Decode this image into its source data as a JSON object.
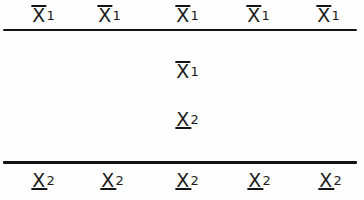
{
  "figure": {
    "background_color": "#fefefe",
    "ink_color": "#141414",
    "width": 364,
    "height": 200
  },
  "rules": [
    {
      "name": "upper-rule",
      "y": 29,
      "thickness": 2,
      "x_start": 3,
      "x_end": 357
    },
    {
      "name": "lower-rule",
      "y": 161,
      "thickness": 3,
      "x_start": 3,
      "x_end": 357
    }
  ],
  "rows": [
    {
      "id": "top-row",
      "position": "above-upper-rule",
      "symbols": [
        {
          "base": "X",
          "bar": "over",
          "index": "1",
          "x": 43
        },
        {
          "base": "X",
          "bar": "over",
          "index": "1",
          "x": 109
        },
        {
          "base": "X",
          "bar": "over",
          "index": "1",
          "x": 187
        },
        {
          "base": "X",
          "bar": "over",
          "index": "1",
          "x": 258
        },
        {
          "base": "X",
          "bar": "over",
          "index": "1",
          "x": 328
        }
      ]
    },
    {
      "id": "middle-row-1",
      "position": "between-rules",
      "symbols": [
        {
          "base": "X",
          "bar": "over",
          "index": "1",
          "x": 187
        }
      ]
    },
    {
      "id": "middle-row-2",
      "position": "between-rules",
      "symbols": [
        {
          "base": "X",
          "bar": "under",
          "index": "2",
          "x": 187
        }
      ]
    },
    {
      "id": "bottom-row",
      "position": "below-lower-rule",
      "symbols": [
        {
          "base": "X",
          "bar": "under",
          "index": "2",
          "x": 43
        },
        {
          "base": "X",
          "bar": "under",
          "index": "2",
          "x": 112
        },
        {
          "base": "X",
          "bar": "under",
          "index": "2",
          "x": 187
        },
        {
          "base": "X",
          "bar": "under",
          "index": "2",
          "x": 259
        },
        {
          "base": "X",
          "bar": "under",
          "index": "2",
          "x": 330
        }
      ]
    }
  ]
}
